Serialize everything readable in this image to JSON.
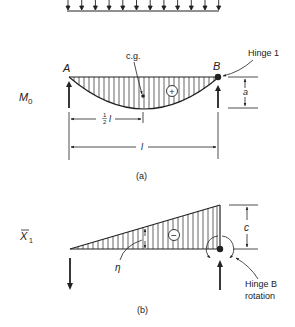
{
  "figure": {
    "panel_a": {
      "caption": "(a)",
      "row_label": "M",
      "row_label_sub": "0",
      "point_a": "A",
      "point_b": "B",
      "cg_label": "c.g.",
      "sign": "+",
      "hinge_label": "Hinge 1",
      "dim_a": "a",
      "dim_half_num": "1",
      "dim_half_den": "2",
      "dim_half_var": "l",
      "dim_full": "l",
      "load_arrow_count": 12
    },
    "panel_b": {
      "caption": "(b)",
      "row_label": "X",
      "row_label_sub": "1",
      "sign": "−",
      "eta_label": "η",
      "dim_c": "c",
      "hinge_label_line1": "Hinge B",
      "hinge_label_line2": "rotation"
    },
    "colors": {
      "ink": "#222222",
      "background": "#ffffff"
    }
  }
}
